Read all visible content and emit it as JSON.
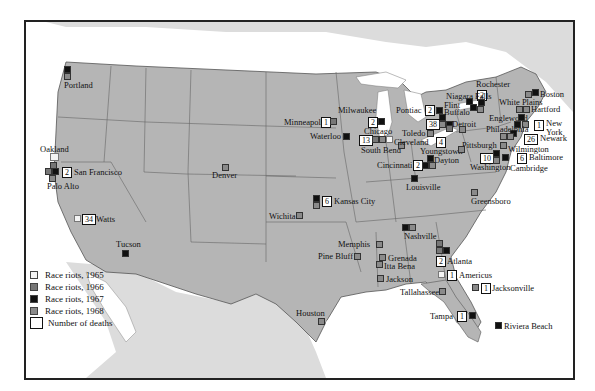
{
  "colors": {
    "land_us": "#b5b5b5",
    "land_other": "#dcdcdc",
    "water": "#ffffff",
    "border": "#666666",
    "race_riots_1965": "#f4f4f4",
    "race_riots_1966": "#777777",
    "race_riots_1967": "#111111",
    "race_riots_1968": "#8a8a8a"
  },
  "legend": {
    "items": [
      {
        "label": "Race riots, 1965",
        "swatch": "1965"
      },
      {
        "label": "Race riots, 1966",
        "swatch": "1966"
      },
      {
        "label": "Race riots, 1967",
        "swatch": "1967"
      },
      {
        "label": "Race riots, 1968",
        "swatch": "1968"
      }
    ],
    "deaths_label": "Number of deaths"
  },
  "cities": [
    {
      "name": "Portland",
      "years": [
        "1967",
        "1968"
      ],
      "deaths": null
    },
    {
      "name": "Oakland",
      "years": [
        "1965",
        "1966"
      ],
      "deaths": null
    },
    {
      "name": "San Francisco",
      "years": [
        "1966",
        "1967"
      ],
      "deaths": "2"
    },
    {
      "name": "Palo Alto",
      "years": [
        "1968"
      ],
      "deaths": null
    },
    {
      "name": "Watts",
      "years": [
        "1965"
      ],
      "deaths": "34"
    },
    {
      "name": "Tucson",
      "years": [
        "1967"
      ],
      "deaths": null
    },
    {
      "name": "Denver",
      "years": [
        "1968"
      ],
      "deaths": null
    },
    {
      "name": "Wichita",
      "years": [
        "1968"
      ],
      "deaths": null
    },
    {
      "name": "Kansas City",
      "years": [
        "1967",
        "1968"
      ],
      "deaths": "6"
    },
    {
      "name": "Houston",
      "years": [
        "1968"
      ],
      "deaths": null
    },
    {
      "name": "Minneapolis",
      "years": [
        "1966"
      ],
      "deaths": "1"
    },
    {
      "name": "Milwaukee",
      "years": [
        "1967"
      ],
      "deaths": "2"
    },
    {
      "name": "Waterloo",
      "years": [
        "1967"
      ],
      "deaths": null
    },
    {
      "name": "Chicago",
      "years": [
        "1966",
        "1968",
        "1965"
      ],
      "deaths": "13"
    },
    {
      "name": "South Bend",
      "years": [
        "1968"
      ],
      "deaths": null
    },
    {
      "name": "Pontiac",
      "years": [
        "1967"
      ],
      "deaths": "2"
    },
    {
      "name": "Flint",
      "years": [
        "1967"
      ],
      "deaths": null
    },
    {
      "name": "Detroit",
      "years": [
        "1967",
        "1968"
      ],
      "deaths": "38"
    },
    {
      "name": "Toledo",
      "years": [
        "1968"
      ],
      "deaths": null
    },
    {
      "name": "Cleveland",
      "years": [
        "1966"
      ],
      "deaths": "4"
    },
    {
      "name": "Youngstown",
      "years": [
        "1968"
      ],
      "deaths": null
    },
    {
      "name": "Dayton",
      "years": [
        "1967"
      ],
      "deaths": null
    },
    {
      "name": "Cincinnati",
      "years": [
        "1967",
        "1968"
      ],
      "deaths": "2"
    },
    {
      "name": "Louisville",
      "years": [
        "1967"
      ],
      "deaths": null
    },
    {
      "name": "Nashville",
      "years": [
        "1967",
        "1968"
      ],
      "deaths": null
    },
    {
      "name": "Memphis",
      "years": [
        "1968"
      ],
      "deaths": null
    },
    {
      "name": "Pine Bluff",
      "years": [
        "1968"
      ],
      "deaths": null
    },
    {
      "name": "Grenada",
      "years": [
        "1968"
      ],
      "deaths": null
    },
    {
      "name": "Itta Bena",
      "years": [
        "1968"
      ],
      "deaths": null
    },
    {
      "name": "Jackson",
      "years": [
        "1968"
      ],
      "deaths": null
    },
    {
      "name": "Atlanta",
      "years": [
        "1966",
        "1967"
      ],
      "deaths": "2"
    },
    {
      "name": "Americus",
      "years": [
        "1965"
      ],
      "deaths": "1"
    },
    {
      "name": "Tallahassee",
      "years": [
        "1968"
      ],
      "deaths": null
    },
    {
      "name": "Jacksonville",
      "years": [
        "1968"
      ],
      "deaths": "1"
    },
    {
      "name": "Tampa",
      "years": [
        "1967"
      ],
      "deaths": "1"
    },
    {
      "name": "Riviera Beach",
      "years": [
        "1967"
      ],
      "deaths": null
    },
    {
      "name": "Greensboro",
      "years": [
        "1968"
      ],
      "deaths": null
    },
    {
      "name": "Rochester",
      "years": [
        "1967"
      ],
      "deaths": "2"
    },
    {
      "name": "Niagara Falls",
      "years": [
        "1967"
      ],
      "deaths": null
    },
    {
      "name": "Buffalo",
      "years": [
        "1967",
        "1968"
      ],
      "deaths": null
    },
    {
      "name": "Boston",
      "years": [
        "1967",
        "1968"
      ],
      "deaths": null
    },
    {
      "name": "White Plains",
      "years": [
        "1968"
      ],
      "deaths": null
    },
    {
      "name": "Hartford",
      "years": [
        "1968"
      ],
      "deaths": null
    },
    {
      "name": "Englewood",
      "years": [
        "1967"
      ],
      "deaths": null
    },
    {
      "name": "New York",
      "years": [
        "1967",
        "1968"
      ],
      "deaths": "1"
    },
    {
      "name": "Newark",
      "years": [
        "1967"
      ],
      "deaths": "26"
    },
    {
      "name": "Philadelphia",
      "years": [
        "1968"
      ],
      "deaths": null
    },
    {
      "name": "Pittsburgh",
      "years": [
        "1968"
      ],
      "deaths": null
    },
    {
      "name": "Wilmington",
      "years": [
        "1968"
      ],
      "deaths": null
    },
    {
      "name": "Washington",
      "years": [
        "1968"
      ],
      "deaths": "10"
    },
    {
      "name": "Baltimore",
      "years": [
        "1967"
      ],
      "deaths": "6"
    },
    {
      "name": "Cambridge",
      "years": [
        "1967"
      ],
      "deaths": null
    }
  ]
}
